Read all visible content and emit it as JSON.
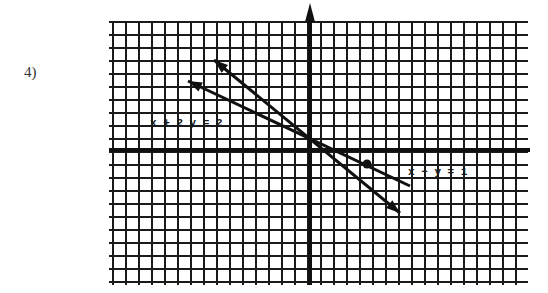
{
  "problem": {
    "number_label": "4)"
  },
  "graph": {
    "type": "coordinate-grid",
    "grid": {
      "left": 113,
      "right": 522,
      "top": 22,
      "bottom": 285,
      "spacing": 13,
      "line_color": "#1a1a1a"
    },
    "axes": {
      "x_axis_y": 150,
      "y_axis_x": 310,
      "y_axis_arrow": "up"
    },
    "lines": [
      {
        "equation_label": "x + 2y = 2",
        "label_pos": [
          150,
          126
        ],
        "start_arrow": [
          188,
          81
        ],
        "end": [
          410,
          186
        ]
      },
      {
        "equation_label": "x − y = 1",
        "label_pos": [
          408,
          175
        ],
        "start_arrow": [
          214,
          60
        ],
        "end_arrow": [
          400,
          213
        ],
        "point": [
          367,
          164
        ]
      }
    ]
  },
  "chart_data": {
    "type": "line",
    "title": "",
    "xlabel": "x",
    "ylabel": "y",
    "grid": true,
    "series": [
      {
        "name": "x + 2y = 2",
        "x": [
          -8,
          0,
          6
        ],
        "y": [
          5,
          1,
          -2
        ]
      },
      {
        "name": "x − y = 1",
        "x": [
          -6,
          0,
          4,
          6
        ],
        "y": [
          7,
          1,
          -1,
          -5
        ]
      }
    ],
    "annotations": [
      "x + 2y = 2",
      "x − y = 1"
    ]
  }
}
